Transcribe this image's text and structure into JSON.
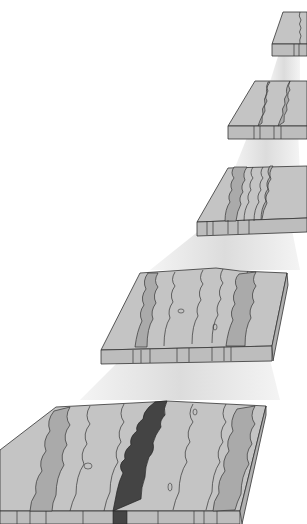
{
  "diagram": {
    "colors": {
      "background": "#ffffff",
      "beam": "#e6e6e6",
      "slab_light": "#c9c9c9",
      "slab_mid": "#b3b3b3",
      "slab_dark": "#9e9e9e",
      "side_face": "#bdbdbd",
      "rift": "#4a4a4a",
      "outline": "#333333"
    },
    "blocks": [
      {
        "id": 1,
        "label": "stage-1"
      },
      {
        "id": 2,
        "label": "stage-2"
      },
      {
        "id": 3,
        "label": "stage-3"
      },
      {
        "id": 4,
        "label": "stage-4"
      },
      {
        "id": 5,
        "label": "stage-5"
      }
    ]
  }
}
